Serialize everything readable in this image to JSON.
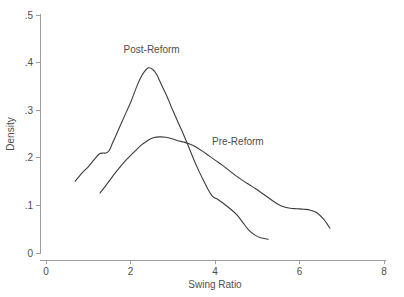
{
  "chart_data": {
    "type": "line",
    "title": "",
    "subtitle": "",
    "xlabel": "Swing Ratio",
    "ylabel": "Density",
    "xlim": [
      0,
      8
    ],
    "ylim": [
      0,
      0.5
    ],
    "xticks": [
      0,
      2,
      4,
      6,
      8
    ],
    "xtick_labels": [
      "0",
      "2",
      "4",
      "6",
      "8"
    ],
    "yticks": [
      0,
      0.1,
      0.2,
      0.3,
      0.4,
      0.5
    ],
    "ytick_labels": [
      "0",
      ".1",
      ".2",
      ".3",
      ".4",
      ".5"
    ],
    "grid": false,
    "legend": "inline-annotations",
    "line_color": "#3c3c3c",
    "axis_color": "#9d9d9d",
    "text_color": "#4d4d4d",
    "background": "#ffffff",
    "series": [
      {
        "name": "Post-Reform",
        "label_x": 2.5,
        "label_y": 0.42,
        "peak_x": 2.42,
        "peak_y": 0.389,
        "x": [
          0.69,
          0.85,
          1.0,
          1.14,
          1.26,
          1.36,
          1.42,
          1.5,
          1.58,
          1.66,
          1.78,
          1.9,
          2.02,
          2.14,
          2.24,
          2.32,
          2.42,
          2.52,
          2.62,
          2.74,
          2.86,
          2.96,
          3.06,
          3.16,
          3.26,
          3.38,
          3.5,
          3.62,
          3.74,
          3.84,
          3.94,
          4.06,
          4.2,
          4.36,
          4.52,
          4.66,
          4.8,
          4.94,
          5.08,
          5.26
        ],
        "y": [
          0.151,
          0.168,
          0.181,
          0.196,
          0.208,
          0.21,
          0.21,
          0.216,
          0.232,
          0.248,
          0.272,
          0.296,
          0.32,
          0.348,
          0.368,
          0.38,
          0.389,
          0.386,
          0.375,
          0.352,
          0.33,
          0.308,
          0.288,
          0.268,
          0.248,
          0.222,
          0.196,
          0.172,
          0.15,
          0.133,
          0.119,
          0.113,
          0.104,
          0.093,
          0.08,
          0.064,
          0.048,
          0.038,
          0.032,
          0.029
        ]
      },
      {
        "name": "Pre-Reform",
        "label_x": 4.54,
        "label_y": 0.227,
        "peak_x": 2.7,
        "peak_y": 0.244,
        "x": [
          1.28,
          1.42,
          1.56,
          1.7,
          1.84,
          1.98,
          2.12,
          2.26,
          2.4,
          2.54,
          2.7,
          2.84,
          2.98,
          3.12,
          3.26,
          3.4,
          3.54,
          3.7,
          3.86,
          4.02,
          4.18,
          4.34,
          4.5,
          4.66,
          4.82,
          4.98,
          5.14,
          5.3,
          5.46,
          5.62,
          5.78,
          5.94,
          6.1,
          6.26,
          6.42,
          6.58,
          6.72
        ],
        "y": [
          0.126,
          0.142,
          0.159,
          0.175,
          0.19,
          0.203,
          0.215,
          0.227,
          0.236,
          0.242,
          0.244,
          0.243,
          0.24,
          0.236,
          0.233,
          0.229,
          0.223,
          0.214,
          0.204,
          0.194,
          0.184,
          0.173,
          0.162,
          0.152,
          0.143,
          0.134,
          0.124,
          0.114,
          0.104,
          0.097,
          0.094,
          0.093,
          0.092,
          0.09,
          0.084,
          0.07,
          0.052
        ]
      }
    ]
  },
  "figure": {
    "ylabel_text": "Density",
    "xlabel_text": "Swing Ratio"
  }
}
